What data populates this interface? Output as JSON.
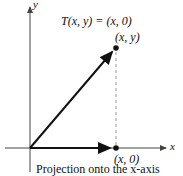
{
  "diagram": {
    "title": "T(x, y) = (x, 0)",
    "point_label": "(x, y)",
    "projection_point_label": "(x, 0)",
    "x_axis_label": "x",
    "y_axis_label": "y",
    "caption": "Projection onto the x-axis",
    "colors": {
      "axis": "#444444",
      "vector": "#111111",
      "dashed": "#999999"
    }
  }
}
